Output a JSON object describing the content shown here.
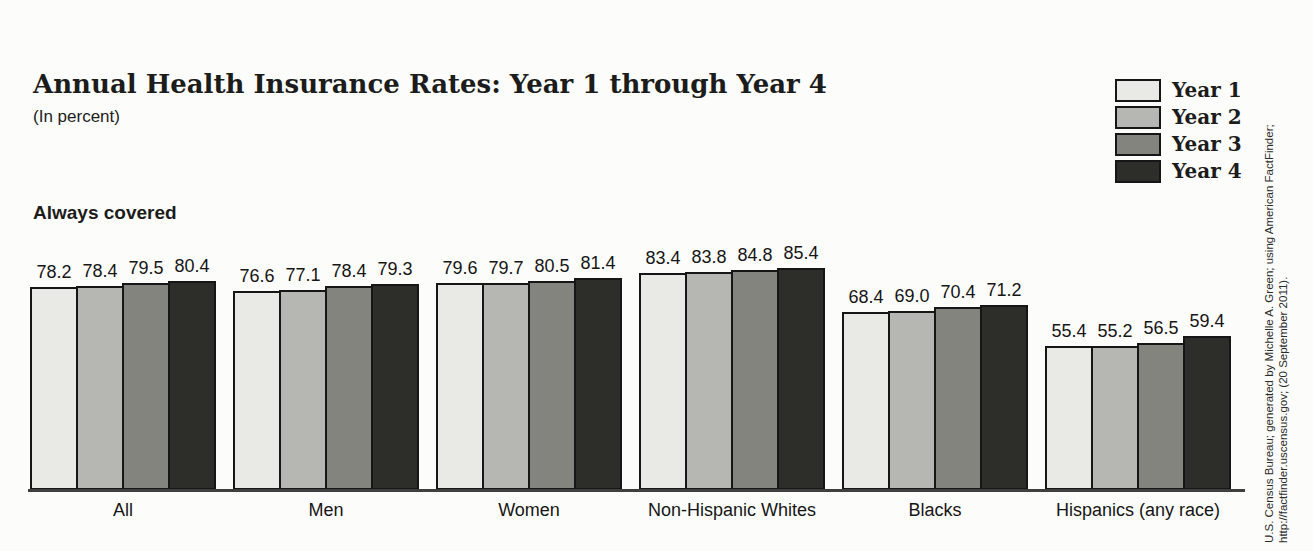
{
  "header": {
    "title_main": "Annual Health Insurance Rates:",
    "title_range": " Year 1 through Year 4",
    "subtitle": "(In percent)"
  },
  "section_label": "Always covered",
  "source": {
    "line1": "U.S. Census Bureau; generated by Michelle A. Green; using American FactFinder;",
    "line2": "http://factfinder.uscensus.gov; (20 September 2011)."
  },
  "colors": {
    "bar_border": "#161616",
    "axis_line": "#3f3f3f",
    "year1": "#e9e9e5",
    "year2": "#b6b6b3",
    "year3": "#84847f",
    "year4": "#2d2d2a"
  },
  "chart_data": {
    "type": "bar",
    "title": "Annual Health Insurance Rates: Year 1 through Year 4",
    "subtitle": "(In percent)",
    "annotation": "Always covered",
    "categories": [
      "All",
      "Men",
      "Women",
      "Non-Hispanic Whites",
      "Blacks",
      "Hispanics (any race)"
    ],
    "series": [
      {
        "name": "Year 1",
        "color": "#e9e9e5",
        "values": [
          78.2,
          76.6,
          79.6,
          83.4,
          68.4,
          55.4
        ]
      },
      {
        "name": "Year 2",
        "color": "#b6b6b3",
        "values": [
          78.4,
          77.1,
          79.7,
          83.8,
          69.0,
          55.2
        ]
      },
      {
        "name": "Year 3",
        "color": "#84847f",
        "values": [
          79.5,
          78.4,
          80.5,
          84.8,
          70.4,
          56.5
        ]
      },
      {
        "name": "Year 4",
        "color": "#2d2d2a",
        "values": [
          80.4,
          79.3,
          81.4,
          85.4,
          71.2,
          59.4
        ]
      }
    ],
    "ylim": [
      0,
      100
    ],
    "grid": false,
    "legend_position": "top-right",
    "value_labels": true,
    "source": "U.S. Census Bureau; generated by Michelle A. Green; using American FactFinder; http://factfinder.uscensus.gov; (20 September 2011)."
  }
}
